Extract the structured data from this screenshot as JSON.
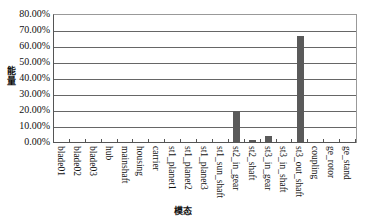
{
  "chart_data": {
    "type": "bar",
    "title": "",
    "xlabel": "模态",
    "ylabel": "能量",
    "ylim": [
      0,
      80
    ],
    "yticks": [
      "0.00%",
      "10.00%",
      "20.00%",
      "30.00%",
      "40.00%",
      "50.00%",
      "60.00%",
      "70.00%",
      "80.00%"
    ],
    "grid": true,
    "legend": null,
    "categories": [
      "blade01",
      "blade02",
      "blade03",
      "hub",
      "mainshaft",
      "housing",
      "carrier",
      "st1_planet1",
      "st1_planet2",
      "st1_planet3",
      "st1_sun_shaft",
      "st2_in_gear",
      "st2_shaft",
      "st3_in_gear",
      "st3_in_shaft",
      "st3_out_shaft",
      "coupling",
      "ge_rotor",
      "ge_stand"
    ],
    "values": [
      0.0,
      0.0,
      0.0,
      0.0,
      0.0,
      0.5,
      0.0,
      0.0,
      0.4,
      0.0,
      0.4,
      20.0,
      2.0,
      4.5,
      0.0,
      67.0,
      0.4,
      0.0,
      0.0
    ],
    "bar_color": "#5a5a5a"
  }
}
